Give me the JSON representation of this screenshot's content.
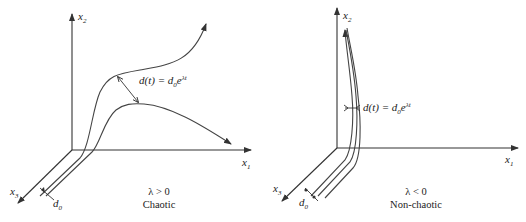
{
  "figure": {
    "panels": [
      {
        "id": "chaotic",
        "axes": {
          "x1": "x",
          "x1_sub": "1",
          "x2": "x",
          "x2_sub": "2",
          "x3": "x",
          "x3_sub": "3"
        },
        "initial_separation": {
          "d": "d",
          "sub": "0"
        },
        "growth_formula": {
          "lhs": "d(t) = d",
          "sub": "0",
          "e": "e",
          "exp": "λt"
        },
        "condition": "λ > 0",
        "caption": "Chaotic"
      },
      {
        "id": "non-chaotic",
        "axes": {
          "x1": "x",
          "x1_sub": "1",
          "x2": "x",
          "x2_sub": "2",
          "x3": "x",
          "x3_sub": "3"
        },
        "initial_separation": {
          "d": "d",
          "sub": "0"
        },
        "growth_formula": {
          "lhs": "d(t) = d",
          "sub": "0",
          "e": "e",
          "exp": "λt"
        },
        "condition": "λ < 0",
        "caption": "Non-chaotic"
      }
    ]
  }
}
